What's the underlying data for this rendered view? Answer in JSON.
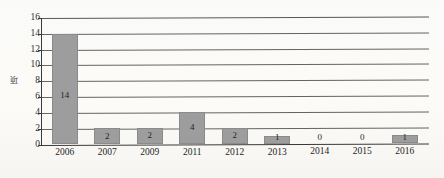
{
  "chart_data": {
    "type": "bar",
    "title": "",
    "xlabel": "",
    "ylabel": "项",
    "categories": [
      "2006",
      "2007",
      "2009",
      "2011",
      "2012",
      "2013",
      "2014",
      "2015",
      "2016"
    ],
    "values": [
      14,
      2,
      2,
      4,
      2,
      1,
      0,
      0,
      1
    ],
    "data_labels": [
      "14",
      "2",
      "2",
      "4",
      "2",
      "1",
      "0",
      "0",
      "1"
    ],
    "ylim": [
      0,
      16
    ],
    "ytick_values": [
      0,
      2,
      4,
      6,
      8,
      10,
      12,
      14,
      16
    ],
    "ytick_labels": [
      "0",
      "2",
      "4",
      "6",
      "8",
      "10",
      "12",
      "14",
      "16"
    ],
    "grid": true,
    "grid_orientation": "horizontal",
    "legend": false,
    "legend_position": "none",
    "bar_color": "#9d9d9d",
    "axis_color": "#3a3a3a",
    "grid_color": "#4a4a4a",
    "label_color": "#1f1f1f",
    "background_color": "#fdfdfc"
  }
}
